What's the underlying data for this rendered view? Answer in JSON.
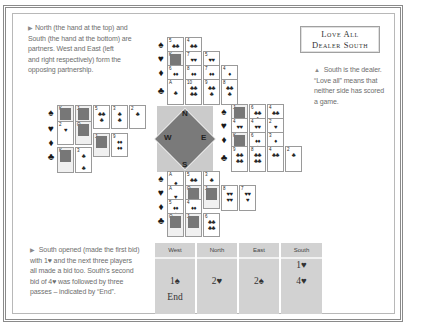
{
  "notes": {
    "north_south": "North (the hand at the top) and South (the hand at the bottom) are partners. West and East (left and right respectively) form the opposing partnership.",
    "north_south_lines": [
      "North (the hand at the top) and",
      "South (the hand at the bottom) are",
      "partners. West and East (left",
      "and right respectively) form the",
      "opposing partnership."
    ],
    "dealer_lines": [
      "South is the dealer.",
      "“Love all” means that",
      "neither side has scored",
      "a game."
    ],
    "bidding_lines": [
      "South opened (made the first bid)",
      "with 1♥ and the next three players",
      "all made a bid too. South’s second",
      "bid of 4♥ was followed by three",
      "passes – indicated by “End”."
    ]
  },
  "vulnerability": {
    "line1": "Love All",
    "line2": "Dealer South"
  },
  "compass": {
    "n": "N",
    "e": "E",
    "s": "S",
    "w": "W"
  },
  "suits": {
    "spades": "♠",
    "hearts": "♥",
    "diamonds": "♦",
    "clubs": "♣"
  },
  "hands": {
    "north": {
      "spades": [
        "5",
        "4"
      ],
      "hearts": [
        "K",
        "7",
        "5"
      ],
      "diamonds": [
        "6",
        "8",
        "7",
        "4"
      ],
      "clubs": [
        "A",
        "10",
        "9",
        "8"
      ]
    },
    "west": {
      "spades": [
        "K",
        "J",
        "5",
        "3",
        "2"
      ],
      "hearts": [
        "2",
        "Q"
      ],
      "diamonds": [
        "A",
        "J",
        "9"
      ],
      "clubs": [
        "K",
        "3"
      ]
    },
    "east": {
      "spades": [
        "J",
        "6",
        "4"
      ],
      "hearts": [
        "4",
        "4",
        "2"
      ],
      "diamonds": [
        "K",
        "6",
        "3"
      ],
      "clubs": [
        "9",
        "8",
        "4",
        "2"
      ]
    },
    "south": {
      "spades": [
        "A",
        "5",
        "3"
      ],
      "hearts": [
        "A",
        "Q",
        "J",
        "8",
        "7"
      ],
      "diamonds": [
        "5",
        "4",
        "K"
      ],
      "clubs": [
        "Q",
        "J",
        "6"
      ]
    }
  },
  "bidding": {
    "headers": [
      "West",
      "North",
      "East",
      "South"
    ],
    "west": [
      "",
      "1♠",
      "End"
    ],
    "north": [
      "",
      "2♥",
      ""
    ],
    "east": [
      "",
      "2♠",
      ""
    ],
    "south": [
      "1♥",
      "4♥",
      ""
    ]
  }
}
